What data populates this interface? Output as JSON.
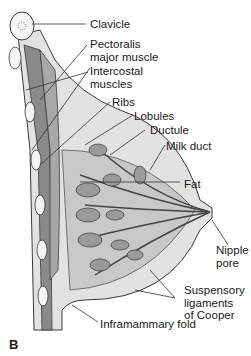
{
  "figure": {
    "panel_label": "B",
    "labels": [
      {
        "id": "clavicle",
        "text": "Clavicle"
      },
      {
        "id": "pectoralis",
        "text": "Pectoralis\nmajor muscle"
      },
      {
        "id": "intercostal",
        "text": "Intercostal\nmuscles"
      },
      {
        "id": "ribs",
        "text": "Ribs"
      },
      {
        "id": "lobules",
        "text": "Lobules"
      },
      {
        "id": "ductule",
        "text": "Ductule"
      },
      {
        "id": "milk-duct",
        "text": "Milk duct"
      },
      {
        "id": "fat",
        "text": "Fat"
      },
      {
        "id": "nipple-pore",
        "text": "Nipple\npore"
      },
      {
        "id": "suspensory",
        "text": "Suspensory\nligaments\nof Cooper"
      },
      {
        "id": "inframammary",
        "text": "Inframammary fold"
      }
    ]
  },
  "colors": {
    "outline": "#3a3a3a",
    "tissue_light": "#dcdcdc",
    "tissue_mid": "#b4b4b4",
    "muscle": "#8a8a8a",
    "lobule": "#9a9a9a"
  }
}
